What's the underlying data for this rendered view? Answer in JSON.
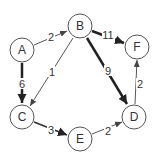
{
  "graph": {
    "type": "directed-weighted-graph",
    "nodes": [
      {
        "id": "A",
        "label": "A",
        "x": 22,
        "y": 50
      },
      {
        "id": "B",
        "label": "B",
        "x": 80,
        "y": 26
      },
      {
        "id": "F",
        "label": "F",
        "x": 137,
        "y": 47
      },
      {
        "id": "C",
        "label": "C",
        "x": 22,
        "y": 117
      },
      {
        "id": "D",
        "label": "D",
        "x": 134,
        "y": 117
      },
      {
        "id": "E",
        "label": "E",
        "x": 80,
        "y": 139
      }
    ],
    "edges": [
      {
        "from": "A",
        "to": "B",
        "weight": "2",
        "bold": false
      },
      {
        "from": "A",
        "to": "C",
        "weight": "6",
        "bold": true
      },
      {
        "from": "B",
        "to": "C",
        "weight": "1",
        "bold": false
      },
      {
        "from": "B",
        "to": "F",
        "weight": "11",
        "bold": true
      },
      {
        "from": "B",
        "to": "D",
        "weight": "9",
        "bold": true
      },
      {
        "from": "C",
        "to": "E",
        "weight": "3",
        "bold": true
      },
      {
        "from": "E",
        "to": "D",
        "weight": "2",
        "bold": false
      },
      {
        "from": "D",
        "to": "F",
        "weight": "2",
        "bold": false
      }
    ]
  }
}
